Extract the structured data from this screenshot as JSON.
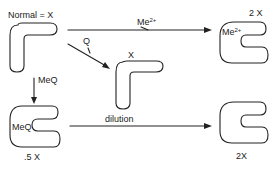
{
  "diagram": {
    "nodes": {
      "normal": {
        "label": "Normal = X",
        "shape": "L-shape"
      },
      "q_bound": {
        "label": "X",
        "shape": "L-shape"
      },
      "me_bound": {
        "label": "2 X",
        "inner_label": "Me",
        "inner_label_sup": "2+",
        "shape": "C-shape"
      },
      "meq_bound": {
        "label": ".5 X",
        "inner_label": "MeQ",
        "shape": "C-shape"
      },
      "diluted": {
        "label": "2X",
        "shape": "C-shape"
      }
    },
    "edges": {
      "me_arrow": {
        "label": "Me",
        "label_sup": "2+",
        "from": "normal",
        "to": "me_bound"
      },
      "q_arrow": {
        "label": "Q",
        "from": "normal",
        "to": "q_bound"
      },
      "meq_arrow": {
        "label": "MeQ",
        "from": "normal",
        "to": "meq_bound"
      },
      "dilution_arrow": {
        "label": "dilution",
        "from": "meq_bound",
        "to": "diluted"
      }
    },
    "colors": {
      "stroke": "#222222",
      "background": "#ffffff"
    }
  }
}
